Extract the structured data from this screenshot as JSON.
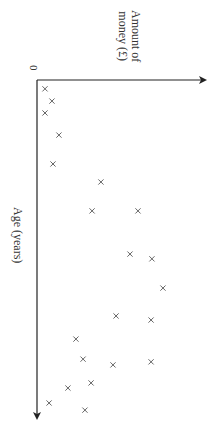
{
  "chart_data": {
    "type": "scatter",
    "orientation": "rotated 90deg clockwise (age axis runs downward, money axis runs rightward)",
    "title": "",
    "xlabel": "Age (years)",
    "ylabel": "Amount of money (£)",
    "origin_label": "0",
    "tick_labels": [
      "0"
    ],
    "grid": false,
    "legend": null,
    "marker": "x",
    "xlim": [
      0,
      100
    ],
    "ylim": [
      0,
      100
    ],
    "units_note": "No numeric ticks shown other than 0; values are in relative units estimated from position",
    "points": [
      {
        "age": 2.6,
        "money": 4.7
      },
      {
        "age": 6.2,
        "money": 8.8
      },
      {
        "age": 9.7,
        "money": 4.7
      },
      {
        "age": 16.2,
        "money": 12.9
      },
      {
        "age": 24.7,
        "money": 9.4
      },
      {
        "age": 30.0,
        "money": 37.6
      },
      {
        "age": 38.5,
        "money": 32.4
      },
      {
        "age": 38.5,
        "money": 59.4
      },
      {
        "age": 51.2,
        "money": 54.7
      },
      {
        "age": 52.6,
        "money": 67.6
      },
      {
        "age": 61.2,
        "money": 74.1
      },
      {
        "age": 69.4,
        "money": 46.5
      },
      {
        "age": 70.6,
        "money": 67.1
      },
      {
        "age": 76.2,
        "money": 22.9
      },
      {
        "age": 82.1,
        "money": 27.1
      },
      {
        "age": 83.8,
        "money": 44.7
      },
      {
        "age": 82.9,
        "money": 67.1
      },
      {
        "age": 89.1,
        "money": 31.8
      },
      {
        "age": 90.6,
        "money": 18.2
      },
      {
        "age": 95.0,
        "money": 7.1
      },
      {
        "age": 97.1,
        "money": 28.2
      }
    ]
  },
  "labels": {
    "money_line1": "Amount of",
    "money_line2": "money (£)",
    "age": "Age (years)",
    "zero": "0"
  },
  "colors": {
    "axis": "#222222",
    "marker": "#555555",
    "background": "#ffffff"
  }
}
